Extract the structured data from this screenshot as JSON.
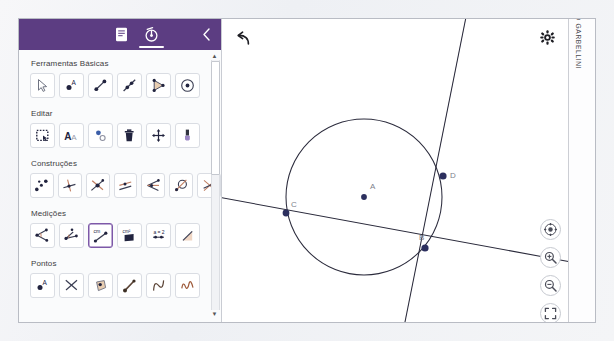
{
  "app": {
    "title": "GeoGebra Geometria",
    "header": {
      "menu_icon": "hamburger-menu-icon",
      "doc_tab_icon": "document-icon",
      "tools_tab_icon": "geometry-tools-icon",
      "collapse_icon": "chevron-left-icon",
      "active_tab": "tools"
    }
  },
  "sidebar": {
    "sections": [
      {
        "title": "Ferramentas Básicas",
        "tools": [
          {
            "name": "move-tool",
            "icon": "arrow-cursor-icon",
            "selected": false
          },
          {
            "name": "point-tool",
            "icon": "point-a-icon",
            "selected": false
          },
          {
            "name": "segment-tool",
            "icon": "segment-icon",
            "selected": false
          },
          {
            "name": "line-tool",
            "icon": "line-icon",
            "selected": false
          },
          {
            "name": "polygon-tool",
            "icon": "polygon-icon",
            "selected": false
          },
          {
            "name": "circle-tool",
            "icon": "circle-center-point-icon",
            "selected": false
          }
        ]
      },
      {
        "title": "Editar",
        "tools": [
          {
            "name": "select-region-tool",
            "icon": "dashed-select-box-icon",
            "selected": false
          },
          {
            "name": "text-tool",
            "icon": "text-aa-icon",
            "selected": false
          },
          {
            "name": "show-hide-object-tool",
            "icon": "show-hide-point-icon",
            "selected": false
          },
          {
            "name": "delete-tool",
            "icon": "trash-icon",
            "selected": false
          },
          {
            "name": "move-graphics-tool",
            "icon": "four-arrows-move-icon",
            "selected": false
          },
          {
            "name": "style-tool",
            "icon": "paint-brush-icon",
            "selected": false
          }
        ]
      },
      {
        "title": "Construções",
        "tools": [
          {
            "name": "midpoint-tool",
            "icon": "midpoint-dots-icon",
            "selected": false
          },
          {
            "name": "perpendicular-line-tool",
            "icon": "perpendicular-line-icon",
            "selected": false
          },
          {
            "name": "intersect-tool",
            "icon": "intersect-lines-icon",
            "selected": false
          },
          {
            "name": "parallel-line-tool",
            "icon": "parallel-lines-icon",
            "selected": false
          },
          {
            "name": "angle-bisector-tool",
            "icon": "angle-bisector-icon",
            "selected": false
          },
          {
            "name": "tangent-tool",
            "icon": "tangent-circle-icon",
            "selected": false
          },
          {
            "name": "perpendicular-bisector-tool",
            "icon": "perpendicular-bisector-icon",
            "selected": false
          }
        ]
      },
      {
        "title": "Medições",
        "tools": [
          {
            "name": "angle-measure-tool",
            "icon": "angle-measure-icon",
            "selected": false
          },
          {
            "name": "angle-fixed-tool",
            "icon": "angle-fixed-icon",
            "selected": false
          },
          {
            "name": "distance-length-tool",
            "icon": "distance-cm-icon",
            "selected": true
          },
          {
            "name": "area-tool",
            "icon": "area-cm2-icon",
            "selected": false
          },
          {
            "name": "ratio-tool",
            "icon": "ratio-a-2-icon",
            "selected": false
          },
          {
            "name": "slope-tool",
            "icon": "slope-icon",
            "selected": false
          }
        ]
      },
      {
        "title": "Pontos",
        "tools": [
          {
            "name": "point-tool-2",
            "icon": "point-a-icon",
            "selected": false
          },
          {
            "name": "intersect-point-tool",
            "icon": "intersect-x-icon",
            "selected": false
          },
          {
            "name": "point-on-object-tool",
            "icon": "point-on-object-icon",
            "selected": false
          },
          {
            "name": "attach-detach-point-tool",
            "icon": "attach-detach-icon",
            "selected": false
          },
          {
            "name": "extremum-tool",
            "icon": "extremum-curve-icon",
            "selected": false
          },
          {
            "name": "roots-tool",
            "icon": "roots-curve-icon",
            "selected": false
          }
        ]
      }
    ],
    "scrollbar": {
      "up_arrow": "▲",
      "down_arrow": "▼"
    }
  },
  "canvas": {
    "undo_icon": "undo-arrow-icon",
    "settings_icon": "gear-icon",
    "credit": "TARCISIO GARBELLINI",
    "controls": [
      {
        "name": "center-view-button",
        "icon": "crosshair-target-icon"
      },
      {
        "name": "zoom-in-button",
        "icon": "magnifier-plus-icon"
      },
      {
        "name": "zoom-out-button",
        "icon": "magnifier-minus-icon"
      },
      {
        "name": "fullscreen-button",
        "icon": "fullscreen-brackets-icon"
      }
    ],
    "geometry": {
      "circle": {
        "cx": 142,
        "cy": 178,
        "r": 78
      },
      "points": [
        {
          "label": "A",
          "x": 142,
          "y": 178,
          "label_dx": 6,
          "label_dy": -11
        },
        {
          "label": "B",
          "x": 202,
          "y": 228,
          "label_dx": -4,
          "label_dy": -15
        },
        {
          "label": "C",
          "x": 64,
          "y": 194,
          "label_dx": 5,
          "label_dy": -13
        },
        {
          "label": "D",
          "x": 220,
          "y": 156,
          "label_dx": 6,
          "label_dy": -4
        }
      ],
      "lines": [
        {
          "name": "secant-line-CB",
          "x1": -10,
          "y1": 177,
          "x2": 360,
          "y2": 245
        },
        {
          "name": "steep-line-DB",
          "x1": 246,
          "y1": -10,
          "x2": 184,
          "y2": 300
        }
      ],
      "point_color": "#2c2f5e",
      "label_color": "#7d7f8c",
      "stroke_color": "#2b2b3c"
    }
  }
}
